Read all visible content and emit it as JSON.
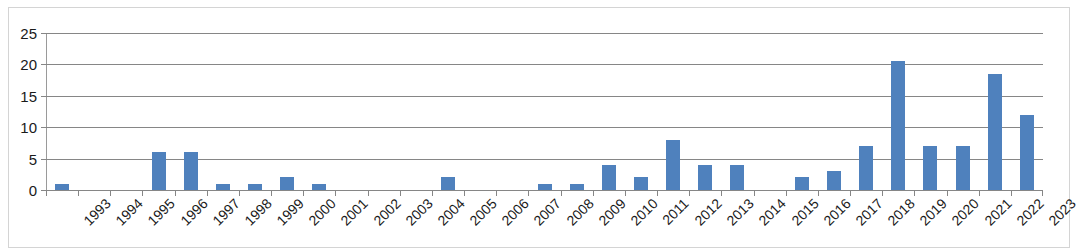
{
  "chart_data": {
    "type": "bar",
    "title": "",
    "subtitle": "",
    "xlabel": "",
    "ylabel": "",
    "categories": [
      "1993",
      "1994",
      "1995",
      "1996",
      "1997",
      "1998",
      "1999",
      "2000",
      "2001",
      "2002",
      "2003",
      "2004",
      "2005",
      "2006",
      "2007",
      "2008",
      "2009",
      "2010",
      "2011",
      "2012",
      "2013",
      "2014",
      "2015",
      "2016",
      "2017",
      "2018",
      "2019",
      "2020",
      "2021",
      "2022",
      "2023"
    ],
    "values": [
      1,
      0,
      0,
      6,
      6,
      1,
      1,
      2,
      1,
      0,
      0,
      0,
      2,
      0,
      0,
      1,
      1,
      4,
      2,
      8,
      4,
      4,
      0,
      2,
      3,
      7,
      20.5,
      7,
      7,
      18.5,
      12
    ],
    "series": [
      {
        "name": "",
        "values": [
          1,
          0,
          0,
          6,
          6,
          1,
          1,
          2,
          1,
          0,
          0,
          0,
          2,
          0,
          0,
          1,
          1,
          4,
          2,
          8,
          4,
          4,
          0,
          2,
          3,
          7,
          20.5,
          7,
          7,
          18.5,
          12
        ]
      }
    ],
    "ylim": [
      0,
      25
    ],
    "yticks": [
      0,
      5,
      10,
      15,
      20,
      25
    ],
    "ytick_labels": [
      "0",
      "5",
      "10",
      "15",
      "20",
      "25"
    ],
    "grid": true,
    "grid_axis": "y",
    "legend": false,
    "legend_position": "none",
    "bar_color": "#4f81bd",
    "gridline_color": "#868686",
    "axis_color": "#9a9a9a",
    "plot_background": "#ffffff",
    "frame_color": "#d4d4d4",
    "annotations": []
  }
}
